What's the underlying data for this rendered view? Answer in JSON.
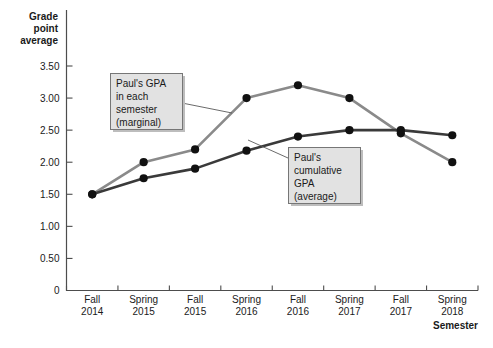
{
  "chart_data": {
    "type": "line",
    "title": "",
    "xlabel": "Semester",
    "ylabel": "Grade point average",
    "categories": [
      "Fall 2014",
      "Spring 2015",
      "Fall 2015",
      "Spring 2016",
      "Fall 2016",
      "Spring 2017",
      "Fall 2017",
      "Spring 2018"
    ],
    "categories_lines": [
      [
        "Fall",
        "2014"
      ],
      [
        "Spring",
        "2015"
      ],
      [
        "Fall",
        "2015"
      ],
      [
        "Spring",
        "2016"
      ],
      [
        "Fall",
        "2016"
      ],
      [
        "Spring",
        "2017"
      ],
      [
        "Fall",
        "2017"
      ],
      [
        "Spring",
        "2018"
      ]
    ],
    "ylim": [
      0,
      3.75
    ],
    "ytick_values": [
      0,
      0.5,
      1.0,
      1.5,
      2.0,
      2.5,
      3.0,
      3.5
    ],
    "ytick_labels": [
      "0",
      "0.50",
      "1.00",
      "1.50",
      "2.00",
      "2.50",
      "3.00",
      "3.50"
    ],
    "grid": false,
    "legend": "none",
    "series": [
      {
        "name": "Paul's GPA in each semester (marginal)",
        "color": "#8a8a8a",
        "values": [
          1.5,
          2.0,
          2.2,
          3.0,
          3.2,
          3.0,
          2.45,
          2.0
        ]
      },
      {
        "name": "Paul's cumulative GPA (average)",
        "color": "#3a3a3a",
        "values": [
          1.5,
          1.75,
          1.9,
          2.18,
          2.4,
          2.5,
          2.5,
          2.42
        ]
      }
    ],
    "annotations": [
      {
        "id": "marginal",
        "lines": [
          "Paul's GPA",
          "in each",
          "semester",
          "(marginal)"
        ],
        "target_category": "Spring 2016",
        "target_value": 3.0
      },
      {
        "id": "cumulative",
        "lines": [
          "Paul's",
          "cumulative",
          "GPA",
          "(average)"
        ],
        "target_category": "Spring 2015",
        "target_value": 1.75
      }
    ]
  },
  "ylabel_lines": [
    "Grade",
    "point",
    "average"
  ],
  "axis": {
    "x_title": "Semester",
    "marker_color": "#111111"
  }
}
